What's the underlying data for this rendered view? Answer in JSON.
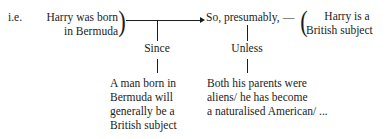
{
  "diagram": {
    "type": "toulmin-argument-model",
    "prefix": "i.e.",
    "datum": {
      "label": "datum",
      "line1": "Harry was born",
      "line2": "in Bermuda",
      "brace": ")"
    },
    "qualifier": {
      "label": "qualifier",
      "text": "So, presumably,"
    },
    "claim": {
      "label": "claim",
      "brace": "(",
      "line1": "Harry is a",
      "line2": "British subject"
    },
    "warrant": {
      "connector": "Since",
      "line1": "A man born in",
      "line2": "Bermuda will",
      "line3": "generally be a",
      "line4": "British subject"
    },
    "rebuttal": {
      "connector": "Unless",
      "line1": "Both his parents were",
      "line2": "aliens/ he has become",
      "line3": "a naturalised American/ ..."
    },
    "dash": "—",
    "colors": {
      "ink": "#1c1c1c",
      "background": "#ffffff"
    }
  }
}
